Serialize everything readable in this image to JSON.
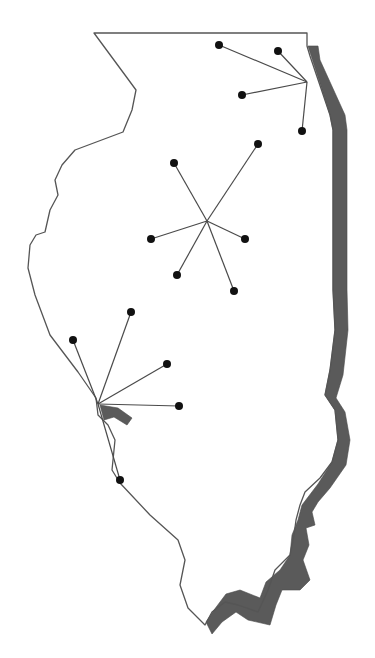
{
  "map": {
    "region": "Illinois",
    "colors": {
      "background": "#ffffff",
      "outline": "#555555",
      "river_band": "#5a5a5a",
      "spoke": "#4a4a4a",
      "node": "#111111"
    },
    "outline_points": "94,33 307,33 307,46 310,56 330,115 333,130 333,290 335,330 330,370 325,395 335,410 338,440 332,462 320,478 305,492 300,505 296,520 294,535 290,555 275,570 268,590 258,612 238,605 225,602 212,612 205,625 198,618 188,608 180,585 185,560 178,540 150,515 120,483 112,470 115,440 108,425 98,415 96,398 78,372 50,335 35,295 28,268 30,245 36,235 45,232 50,210 58,195 55,180 62,165 75,150 123,132 132,110 136,90 125,75 94,33",
    "east_river_band": "308,46 318,46 320,60 345,115 347,130 347,290 348,330 343,375 336,398 345,412 350,440 346,465 330,488 318,502 312,512 315,525 306,528 309,545 303,560 310,580 300,590 282,590 276,605 270,625 248,620 236,612 222,622 212,634 206,622 214,610 226,594 240,590 260,598 266,582 280,570 290,555 292,535 298,520 302,505 318,484 332,462 338,440 335,410 325,395 330,370 335,330 333,290 333,130 330,115",
    "west_river_band": "100,405 118,408 132,418 127,425 114,417 104,420",
    "hubs": [
      {
        "name": "chicago-hub",
        "center": [
          307,
          82
        ],
        "spokes": [
          [
            219,
            45
          ],
          [
            278,
            51
          ],
          [
            242,
            95
          ],
          [
            302,
            131
          ]
        ]
      },
      {
        "name": "central-hub",
        "center": [
          207,
          221
        ],
        "spokes": [
          [
            174,
            163
          ],
          [
            258,
            144
          ],
          [
            151,
            239
          ],
          [
            245,
            239
          ],
          [
            177,
            275
          ],
          [
            234,
            291
          ]
        ]
      },
      {
        "name": "southwest-hub",
        "center": [
          98,
          404
        ],
        "spokes": [
          [
            73,
            340
          ],
          [
            131,
            312
          ],
          [
            167,
            364
          ],
          [
            179,
            406
          ],
          [
            120,
            480
          ]
        ]
      }
    ],
    "node_radius": 4
  }
}
